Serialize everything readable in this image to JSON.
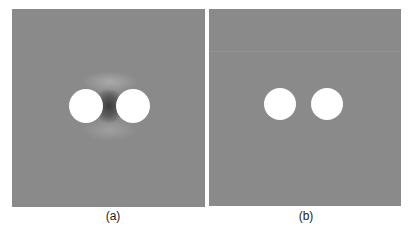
{
  "figure": {
    "panels": [
      {
        "label": "(a)",
        "background": "#8a8a8a",
        "description": "Two white circular holes with dark shading in the gap between them (field interaction)",
        "circles": [
          {
            "cx": 74,
            "cy": 97,
            "r": 17
          },
          {
            "cx": 121,
            "cy": 97,
            "r": 17
          }
        ]
      },
      {
        "label": "(b)",
        "background": "#8a8a8a",
        "description": "Two white circular holes on uniform gray background, no interaction shading",
        "circles": [
          {
            "cx": 71,
            "cy": 95,
            "r": 16
          },
          {
            "cx": 118,
            "cy": 95,
            "r": 16
          }
        ]
      }
    ]
  }
}
